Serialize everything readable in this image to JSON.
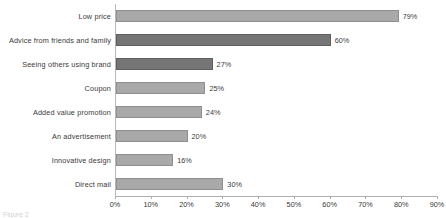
{
  "chart_data": {
    "type": "bar",
    "orientation": "horizontal",
    "title": "",
    "xlabel": "",
    "ylabel": "",
    "xlim": [
      0,
      90
    ],
    "grid": false,
    "legend": "none",
    "xtick_labels": [
      "0%",
      "10%",
      "20%",
      "30%",
      "40%",
      "50%",
      "60%",
      "70%",
      "80%",
      "90%"
    ],
    "xtick_values": [
      0,
      10,
      20,
      30,
      40,
      50,
      60,
      70,
      80,
      90
    ],
    "categories": [
      "Low price",
      "Advice from friends and family",
      "Seeing others using brand",
      "Coupon",
      "Added value promotion",
      "An advertisement",
      "Innovative design",
      "Direct mail"
    ],
    "values": [
      79,
      60,
      27,
      25,
      24,
      20,
      16,
      30
    ],
    "value_labels": [
      "79%",
      "60%",
      "27%",
      "25%",
      "24%",
      "20%",
      "16%",
      "30%"
    ],
    "bar_colors": [
      "light",
      "dark",
      "dark",
      "light",
      "light",
      "light",
      "light",
      "light"
    ]
  },
  "colors": {
    "bar_light": "#a9a9a9",
    "bar_dark": "#757575",
    "axis": "#b0b0b0",
    "text": "#3a3a3a"
  },
  "caption": {
    "text": "Figure 2"
  }
}
